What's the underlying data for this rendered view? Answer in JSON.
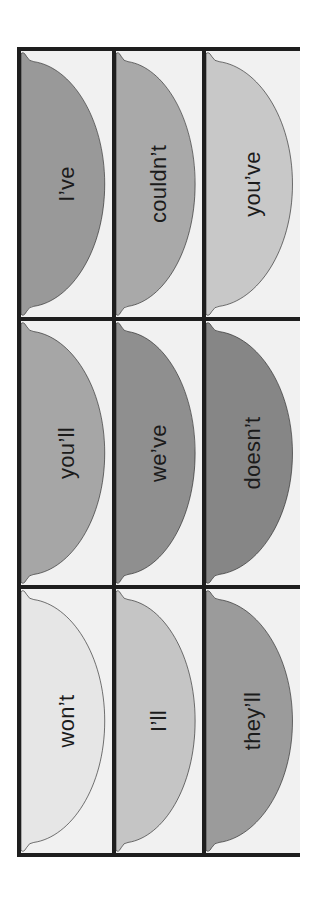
{
  "worksheet": {
    "title": "",
    "cards": [
      {
        "word": "I’ve",
        "fill": "#999999"
      },
      {
        "word": "couldn’t",
        "fill": "#a9a9a9"
      },
      {
        "word": "you’ve",
        "fill": "#c8c8c8"
      },
      {
        "word": "you’ll",
        "fill": "#a6a6a6"
      },
      {
        "word": "we’ve",
        "fill": "#8f8f8f"
      },
      {
        "word": "doesn’t",
        "fill": "#868686"
      },
      {
        "word": "won’t",
        "fill": "#e6e6e6"
      },
      {
        "word": "I’ll",
        "fill": "#c5c5c5"
      },
      {
        "word": "they’ll",
        "fill": "#9b9b9b"
      }
    ]
  }
}
